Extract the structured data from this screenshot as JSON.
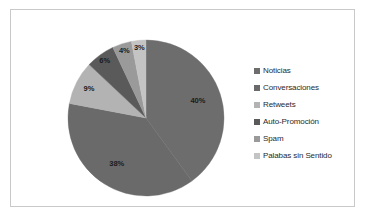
{
  "chart_data": {
    "type": "pie",
    "title": "",
    "legend_position": "right",
    "grid": false,
    "categories": [
      "Noticias",
      "Conversaciones",
      "Retweets",
      "Auto-Promoción",
      "Spam",
      "Palabas sin Sentido"
    ],
    "values": [
      40,
      38,
      9,
      6,
      4,
      3
    ],
    "value_labels": [
      "40%",
      "38%",
      "9%",
      "6%",
      "4%",
      "3%"
    ],
    "unit": "%",
    "total": 100,
    "colors": [
      "#6d6d6d",
      "#6a6a6a",
      "#b3b3b3",
      "#5a5a5a",
      "#9a9a9a",
      "#c4c4c4"
    ],
    "slices": [
      {
        "label": "Noticias",
        "value": 40,
        "value_label": "40%",
        "color": "#6d6d6d"
      },
      {
        "label": "Conversaciones",
        "value": 38,
        "value_label": "38%",
        "color": "#6a6a6a"
      },
      {
        "label": "Retweets",
        "value": 9,
        "value_label": "9%",
        "color": "#b3b3b3"
      },
      {
        "label": "Auto-Promoción",
        "value": 6,
        "value_label": "6%",
        "color": "#5a5a5a"
      },
      {
        "label": "Spam",
        "value": 4,
        "value_label": "4%",
        "color": "#9a9a9a"
      },
      {
        "label": "Palabas sin Sentido",
        "value": 3,
        "value_label": "3%",
        "color": "#c4c4c4"
      }
    ]
  },
  "legend": {
    "items": [
      {
        "label": "Noticias",
        "color": "#6d6d6d"
      },
      {
        "label": "Conversaciones",
        "color": "#6a6a6a"
      },
      {
        "label": "Retweets",
        "color": "#b3b3b3"
      },
      {
        "label": "Auto-Promoción",
        "color": "#5a5a5a"
      },
      {
        "label": "Spam",
        "color": "#9a9a9a"
      },
      {
        "label": "Palabas sin Sentido",
        "color": "#c4c4c4"
      }
    ]
  },
  "style": {
    "border_color": "#c9c9c9",
    "background": "#ffffff"
  }
}
